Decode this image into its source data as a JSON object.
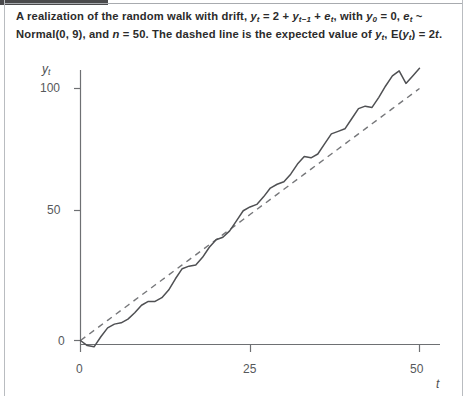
{
  "figure": {
    "caption_line1": "A realization of the random walk with drift, yₜ = 2 + yₜ₋₁ + eₜ, with y₀ = 0, eₜ ~",
    "caption_line2": "Normal(0, 9), and n = 50. The dashed line is the expected value of yₜ, E(yₜ) = 2t.",
    "caption_full": "A realization of the random walk with drift, y_t = 2 + y_{t-1} + e_t, with y_0 = 0, e_t ~ Normal(0, 9), and n = 50. The dashed line is the expected value of y_t, E(y_t) = 2t."
  },
  "axes": {
    "y_label": "y",
    "y_label_sub": "t",
    "x_label": "t",
    "y_ticks": [
      "0",
      "50",
      "100"
    ],
    "x_ticks": [
      "0",
      "25",
      "50"
    ]
  },
  "colors": {
    "walk_line": "#4f5053",
    "expected_line": "#76777a",
    "axis": "#6e7073",
    "text": "#2b2b2b",
    "background": "#ffffff"
  },
  "chart_data": {
    "type": "line",
    "title": "",
    "xlabel": "t",
    "ylabel": "y_t",
    "xlim": [
      0,
      50
    ],
    "ylim": [
      -10,
      115
    ],
    "grid": false,
    "legend": "none",
    "x": [
      0,
      1,
      2,
      3,
      4,
      5,
      6,
      7,
      8,
      9,
      10,
      11,
      12,
      13,
      14,
      15,
      16,
      17,
      18,
      19,
      20,
      21,
      22,
      23,
      24,
      25,
      26,
      27,
      28,
      29,
      30,
      31,
      32,
      33,
      34,
      35,
      36,
      37,
      38,
      39,
      40,
      41,
      42,
      43,
      44,
      45,
      46,
      47,
      48,
      49,
      50
    ],
    "series": [
      {
        "name": "Random walk with drift",
        "style": "solid",
        "values": [
          0,
          -2.0,
          -2.5,
          1.5,
          5.0,
          6.5,
          7.0,
          8.5,
          11.0,
          14.0,
          15.5,
          15.5,
          17.0,
          20.0,
          24.5,
          28.5,
          29.5,
          30.0,
          33.0,
          37.0,
          40.0,
          41.0,
          43.5,
          47.5,
          51.5,
          53.0,
          54.0,
          57.0,
          60.5,
          62.0,
          63.0,
          66.0,
          70.0,
          73.0,
          72.5,
          74.0,
          78.0,
          82.0,
          83.0,
          84.0,
          88.0,
          92.0,
          93.0,
          92.5,
          96.5,
          101.0,
          105.0,
          107.0,
          102.0,
          105.0,
          108.0
        ]
      },
      {
        "name": "Expected value E(y_t) = 2t",
        "style": "dashed",
        "values": [
          0,
          2,
          4,
          6,
          8,
          10,
          12,
          14,
          16,
          18,
          20,
          22,
          24,
          26,
          28,
          30,
          32,
          34,
          36,
          38,
          40,
          42,
          44,
          46,
          48,
          50,
          52,
          54,
          56,
          58,
          60,
          62,
          64,
          66,
          68,
          70,
          72,
          74,
          76,
          78,
          80,
          82,
          84,
          86,
          88,
          90,
          92,
          94,
          96,
          98,
          100
        ]
      }
    ]
  }
}
